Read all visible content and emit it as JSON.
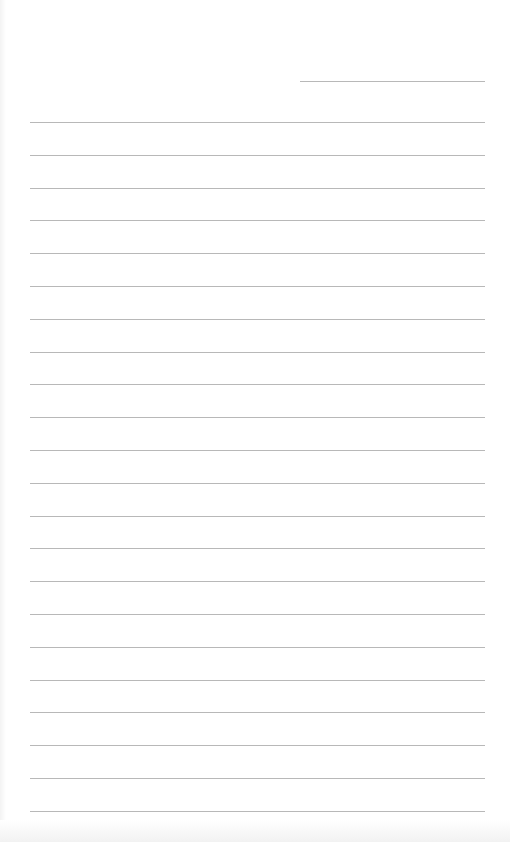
{
  "page": {
    "type": "lined-paper",
    "background": "#ffffff",
    "line_color": "#b8b8b8",
    "header_line": {
      "left": 300,
      "top": 81,
      "width": 185
    },
    "rules": {
      "left": 30,
      "width": 455,
      "first_top": 122,
      "spacing": 32.8,
      "count": 22
    }
  }
}
